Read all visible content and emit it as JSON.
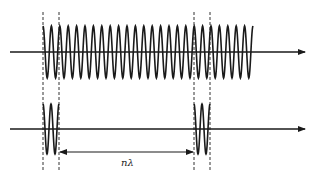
{
  "diagram": {
    "type": "wave-packet comparison",
    "colors": {
      "stroke": "#1a1a1a",
      "dashed": "#333333",
      "background": "#ffffff"
    },
    "top_signal": {
      "description": "continuous sinusoidal wave train on horizontal axis",
      "axis": {
        "x_start": 10,
        "x_end": 305,
        "y": 52
      },
      "wave": {
        "x_start": 43,
        "x_end": 253,
        "cycles": 25,
        "amplitude": 26,
        "center_y": 52
      }
    },
    "bottom_signal": {
      "description": "two short wave pulses separated by n lambda",
      "axis": {
        "x_start": 10,
        "x_end": 305,
        "y": 129
      },
      "pulses": [
        {
          "x_start": 43,
          "x_end": 59,
          "cycles": 2,
          "amplitude": 25,
          "center_y": 129
        },
        {
          "x_start": 194,
          "x_end": 210,
          "cycles": 2,
          "amplitude": 25,
          "center_y": 129
        }
      ]
    },
    "dashed_lines": [
      {
        "x": 43,
        "y_start": 12,
        "y_end": 172
      },
      {
        "x": 59,
        "y_start": 12,
        "y_end": 172
      },
      {
        "x": 194,
        "y_start": 12,
        "y_end": 172
      },
      {
        "x": 210,
        "y_start": 12,
        "y_end": 172
      }
    ],
    "distance_arrow": {
      "x_start": 59,
      "x_end": 194,
      "y": 152,
      "label": "nλ",
      "label_x": 121,
      "label_y": 158
    }
  }
}
